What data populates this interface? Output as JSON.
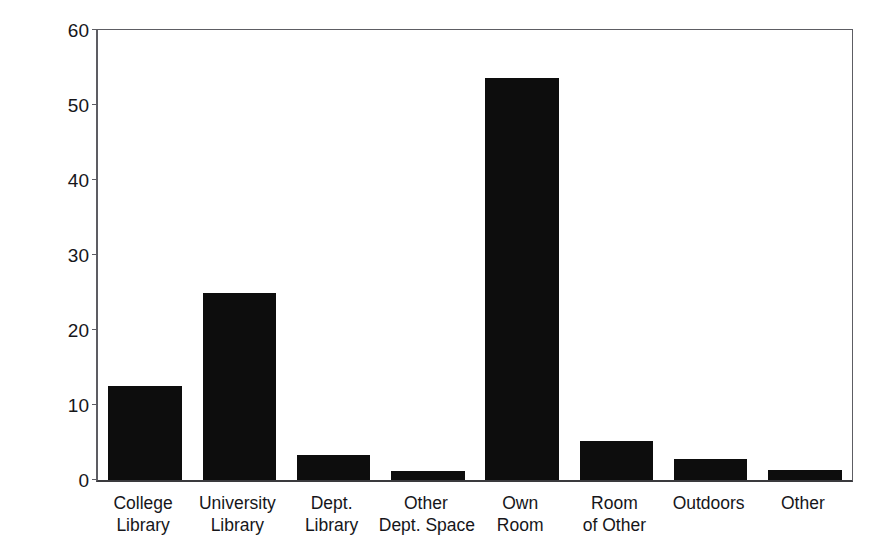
{
  "chart_data": {
    "type": "bar",
    "title": "",
    "xlabel": "",
    "ylabel": "Mean Percent",
    "ylim": [
      0,
      60
    ],
    "yticks": [
      0,
      10,
      20,
      30,
      40,
      50,
      60
    ],
    "grid": false,
    "legend": false,
    "bar_color": "#0d0d0d",
    "axis_color": "#5d5d63",
    "background": "#ffffff",
    "categories": [
      "College Library",
      "University Library",
      "Dept. Library",
      "Other Dept. Space",
      "Own Room",
      "Room of Other",
      "Outdoors",
      "Other"
    ],
    "category_lines": [
      [
        "College",
        "Library"
      ],
      [
        "University",
        "Library"
      ],
      [
        "Dept.",
        "Library"
      ],
      [
        "Other",
        "Dept. Space"
      ],
      [
        "Own",
        "Room"
      ],
      [
        "Room",
        "of Other"
      ],
      [
        "Outdoors"
      ],
      [
        "Other"
      ]
    ],
    "values": [
      12.6,
      25.0,
      3.4,
      1.2,
      53.6,
      5.2,
      2.8,
      1.4
    ]
  }
}
